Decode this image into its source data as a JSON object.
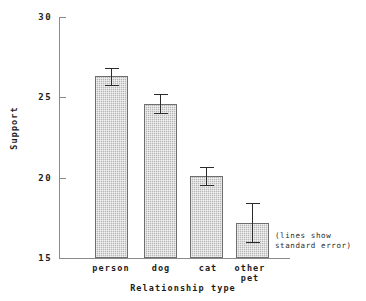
{
  "chart_data": {
    "type": "bar",
    "title": "",
    "xlabel": "Relationship type",
    "ylabel": "Support",
    "categories": [
      "person",
      "dog",
      "cat",
      "other\npet"
    ],
    "values": [
      26.3,
      24.6,
      20.1,
      17.2
    ],
    "errors": [
      0.55,
      0.6,
      0.55,
      1.2
    ],
    "ylim": [
      15,
      30
    ],
    "yticks": [
      30,
      25,
      20,
      15
    ],
    "ytick_labels": [
      "30",
      "25",
      "20",
      "15"
    ],
    "grid": false,
    "legend": false,
    "annotation": "(lines show\nstandard error)",
    "error_bar_meaning": "standard error"
  },
  "axis": {
    "y_tick_0": "30",
    "y_tick_1": "25",
    "y_tick_2": "20",
    "y_tick_3": "15",
    "x_title": "Relationship type",
    "y_title": "Support"
  },
  "categories": {
    "c0": "person",
    "c1": "dog",
    "c2": "cat",
    "c3": "other\npet"
  },
  "note": {
    "text": "(lines show\nstandard error)"
  },
  "colors": {
    "bar_fill": "#b6b6b6",
    "bar_border": "#6e6e6e",
    "axis": "#8a8a8a",
    "error_bar": "#2b2b2b",
    "text": "#1b1b1b",
    "background": "#ffffff"
  }
}
